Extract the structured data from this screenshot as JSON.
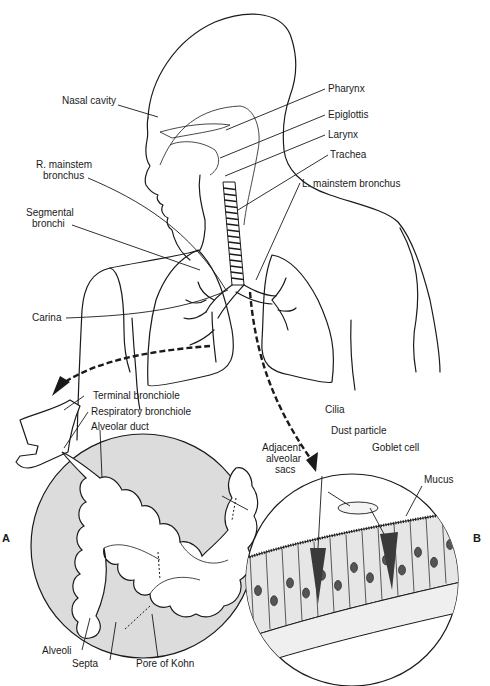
{
  "figure": {
    "type": "anatomical-diagram"
  },
  "labels": {
    "nasal_cavity": "Nasal cavity",
    "pharynx": "Pharynx",
    "epiglottis": "Epiglottis",
    "larynx": "Larynx",
    "trachea": "Trachea",
    "r_mainstem_1": "R. mainstem",
    "r_mainstem_2": "bronchus",
    "l_mainstem": "L. mainstem bronchus",
    "segmental_1": "Segmental",
    "segmental_2": "bronchi",
    "carina": "Carina",
    "terminal_bronchiole": "Terminal bronchiole",
    "respiratory_bronchiole": "Respiratory bronchiole",
    "alveolar_duct": "Alveolar duct",
    "adjacent_1": "Adjacent",
    "adjacent_2": "alveolar",
    "adjacent_3": "sacs",
    "alveoli": "Alveoli",
    "septa": "Septa",
    "pore_of_kohn": "Pore of Kohn",
    "cilia": "Cilia",
    "dust_particle": "Dust particle",
    "goblet_cell": "Goblet cell",
    "mucus": "Mucus"
  },
  "panels": {
    "a": "A",
    "b": "B"
  },
  "colors": {
    "ink": "#1a1a1a",
    "inset_fill": "#dcdcdc",
    "alveoli_fill": "#ffffff",
    "epithelium_fill": "#e6e6e6",
    "goblet_fill": "#3a3a3a"
  }
}
